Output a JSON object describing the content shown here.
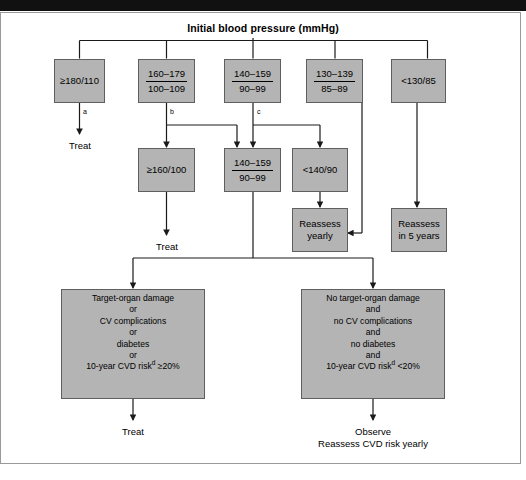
{
  "title": "Initial blood pressure (mmHg)",
  "colors": {
    "node_fill": "#b4b4b4",
    "node_border": "#5f5f5f",
    "line": "#1a1a1a",
    "frame_border": "#9a9a9a",
    "top_bar": "#111111",
    "text": "#000000"
  },
  "row1": {
    "box1": {
      "text": "≥180/110"
    },
    "box2": {
      "numerator": "160–179",
      "denominator": "100–109"
    },
    "box3": {
      "numerator": "140–159",
      "denominator": "90–99"
    },
    "box4": {
      "numerator": "130–139",
      "denominator": "85–89"
    },
    "box5": {
      "text": "<130/85"
    }
  },
  "branch_letters": {
    "a": "a",
    "b": "b",
    "c": "c"
  },
  "row2": {
    "treat_left": "Treat",
    "box1": {
      "text": "≥160/100"
    },
    "box2": {
      "numerator": "140–159",
      "denominator": "90–99"
    },
    "box3": {
      "text": "<140/90"
    }
  },
  "row3": {
    "treat_mid": "Treat",
    "reassess_yearly": {
      "line1": "Reassess",
      "line2": "yearly"
    },
    "reassess_5years": {
      "line1": "Reassess",
      "line2": "in 5 years"
    }
  },
  "row4": {
    "left_box": {
      "lines": [
        "Target-organ damage",
        "or",
        "CV complications",
        "or",
        "diabetes",
        "or"
      ],
      "last_pre": "10-year CVD risk",
      "last_sup": "d",
      "last_post": " ≥20%"
    },
    "right_box": {
      "lines": [
        "No target-organ damage",
        "and",
        "no CV complications",
        "and",
        "no diabetes",
        "and"
      ],
      "last_pre": "10-year CVD risk",
      "last_sup": "d",
      "last_post": " <20%"
    }
  },
  "row5": {
    "treat_bottom": "Treat",
    "observe_line1": "Observe",
    "observe_line2": "Reassess CVD risk yearly"
  }
}
